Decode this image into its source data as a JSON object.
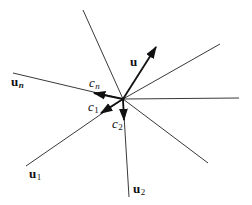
{
  "diagram": {
    "center": [
      123,
      99
    ],
    "lines": [
      {
        "name": "ray-upper-left",
        "to": [
          83,
          10
        ]
      },
      {
        "name": "ray-upper-right",
        "to": [
          220,
          44
        ]
      },
      {
        "name": "ray-right",
        "to": [
          239,
          98
        ]
      },
      {
        "name": "ray-lower-right",
        "to": [
          208,
          163
        ]
      },
      {
        "name": "ray-u2",
        "to": [
          129,
          197
        ]
      },
      {
        "name": "ray-u1",
        "to": [
          26,
          166
        ]
      },
      {
        "name": "ray-un",
        "to": [
          13,
          73
        ]
      }
    ],
    "vectors": [
      {
        "name": "vector-u",
        "to": [
          156,
          47
        ]
      },
      {
        "name": "vector-cn",
        "to": [
          94,
          93
        ]
      },
      {
        "name": "vector-c1",
        "to": [
          100,
          113
        ]
      },
      {
        "name": "vector-c2",
        "to": [
          124,
          120
        ]
      }
    ],
    "labels": {
      "u": "u",
      "un_base": "u",
      "un_sub": "n",
      "u1_base": "u",
      "u1_sub": "1",
      "u2_base": "u",
      "u2_sub": "2",
      "cn_base": "c",
      "cn_sub": "n",
      "c1_base": "c",
      "c1_sub": "1",
      "c2_base": "c",
      "c2_sub": "2"
    }
  }
}
